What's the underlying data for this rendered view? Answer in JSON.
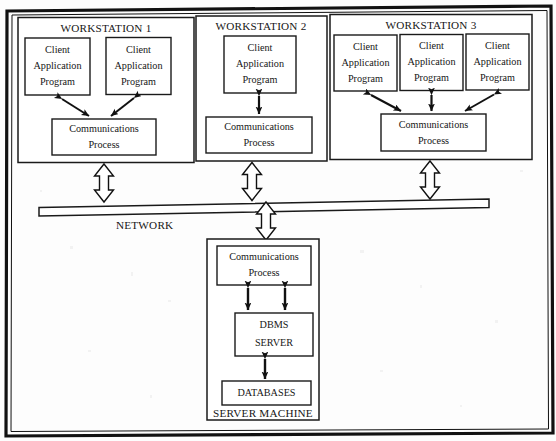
{
  "diagram": {
    "network": {
      "label": "NETWORK"
    },
    "server_machine": {
      "label": "SERVER MACHINE",
      "nodes": [
        {
          "id": "server-comm",
          "label_line1": "Communications",
          "label_line2": "Process"
        },
        {
          "id": "dbms-server",
          "label_line1": "DBMS",
          "label_line2": "SERVER"
        },
        {
          "id": "databases",
          "label_line1": "DATABASES",
          "label_line2": ""
        }
      ]
    },
    "workstations": [
      {
        "id": "workstation-1",
        "title": "WORKSTATION 1",
        "clients": [
          {
            "line1": "Client",
            "line2": "Application",
            "line3": "Program"
          },
          {
            "line1": "Client",
            "line2": "Application",
            "line3": "Program"
          }
        ],
        "comm": {
          "line1": "Communications",
          "line2": "Process"
        }
      },
      {
        "id": "workstation-2",
        "title": "WORKSTATION 2",
        "clients": [
          {
            "line1": "Client",
            "line2": "Application",
            "line3": "Program"
          }
        ],
        "comm": {
          "line1": "Communications",
          "line2": "Process"
        }
      },
      {
        "id": "workstation-3",
        "title": "WORKSTATION 3",
        "clients": [
          {
            "line1": "Client",
            "line2": "Application",
            "line3": "Program"
          },
          {
            "line1": "Client",
            "line2": "Application",
            "line3": "Program"
          },
          {
            "line1": "Client",
            "line2": "Application",
            "line3": "Program"
          }
        ],
        "comm": {
          "line1": "Communications",
          "line2": "Process"
        }
      }
    ],
    "colors": {
      "ink": "#161616",
      "paper": "#fdfdfd",
      "box_fill": "#ffffff"
    }
  }
}
